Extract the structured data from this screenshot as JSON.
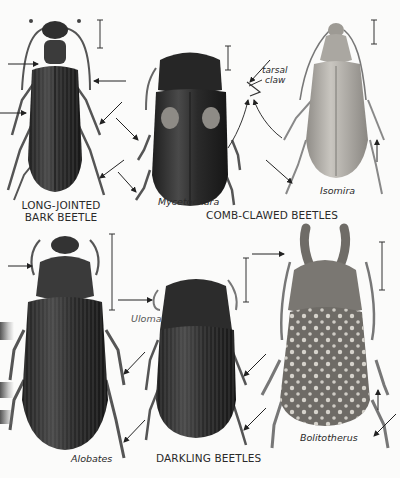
{
  "plate": {
    "group_labels": {
      "long_jointed": [
        "LONG-JOINTED",
        "BARK BEETLE"
      ],
      "comb_clawed": "COMB-CLAWED BEETLES",
      "darkling": "DARKLING BEETLES"
    },
    "species_labels": {
      "mycetochara": "Mycetochara",
      "isomira": "Isomira",
      "uloma": "Uloma",
      "alobates": "Alobates",
      "bolitotherus": "Bolitotherus"
    },
    "annotations": {
      "tarsal_claw": [
        "tarsal",
        "claw"
      ]
    },
    "colors": {
      "ink": "#2a2a2a",
      "dark_beetle": "#2b2b2b",
      "light_beetle": "#b9b6b0",
      "paper": "#fbfbfa"
    }
  }
}
